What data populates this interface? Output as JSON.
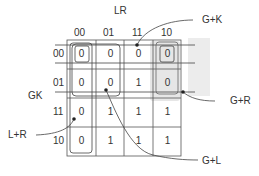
{
  "title": "",
  "axis": {
    "col_var": "LR",
    "row_var": "GK",
    "col_labels": [
      "00",
      "01",
      "11",
      "10"
    ],
    "row_labels": [
      "00",
      "01",
      "11",
      "10"
    ]
  },
  "cells": [
    [
      "0",
      "0",
      "0",
      "0"
    ],
    [
      "0",
      "0",
      "1",
      "0"
    ],
    [
      "0",
      "1",
      "1",
      "1"
    ],
    [
      "0",
      "1",
      "1",
      "1"
    ]
  ],
  "groups": [
    {
      "label": "G+K",
      "cells": "row 00"
    },
    {
      "label": "G+R",
      "cells": "column 10, rows 00-01"
    },
    {
      "label": "G+L",
      "cells": "rows 00-01, columns 00-01"
    },
    {
      "label": "L+R",
      "cells": "column 00"
    }
  ],
  "annotations": {
    "gk": "G+K",
    "gr": "G+R",
    "gl": "G+L",
    "lr": "L+R"
  },
  "colors": {
    "line": "#444444",
    "shade": "#e6e6e6"
  }
}
